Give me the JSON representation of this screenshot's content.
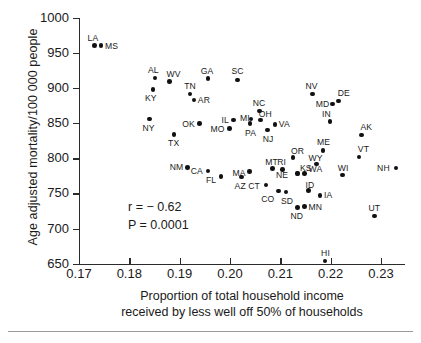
{
  "chart_data": {
    "type": "scatter",
    "title": "",
    "xlabel": "Proportion of total household income received by less well off 50% of households",
    "ylabel": "Age adjusted mortality/100 000 people",
    "xlim": [
      0.17,
      0.2348
    ],
    "ylim": [
      650,
      1000
    ],
    "xticks": [
      0.17,
      0.18,
      0.19,
      0.2,
      0.21,
      0.22,
      0.23
    ],
    "xticklabels": [
      "0.17",
      "0.18",
      "0.19",
      "0.20",
      "0.21",
      "0.22",
      "0.23"
    ],
    "yticks": [
      650,
      700,
      750,
      800,
      850,
      900,
      950,
      1000
    ],
    "yticklabels": [
      "650",
      "700",
      "750",
      "800",
      "850",
      "900",
      "950",
      "1000"
    ],
    "grid": false,
    "legend": null,
    "annotations": {
      "correlation_line": "r = − 0.62",
      "pvalue_line": "P = 0.0001",
      "r": -0.62,
      "p": 0.0001
    },
    "point_label_key": "US state abbreviation",
    "points": [
      {
        "label": "LA",
        "x": 0.1731,
        "y": 960,
        "lx": -7,
        "ly": -13
      },
      {
        "label": "MS",
        "x": 0.1744,
        "y": 960,
        "lx": 4,
        "ly": -5
      },
      {
        "label": "AL",
        "x": 0.1851,
        "y": 914,
        "lx": -7,
        "ly": -13
      },
      {
        "label": "WV",
        "x": 0.188,
        "y": 909,
        "lx": -3,
        "ly": -13
      },
      {
        "label": "GA",
        "x": 0.1956,
        "y": 913,
        "lx": -7,
        "ly": -13
      },
      {
        "label": "SC",
        "x": 0.2015,
        "y": 911,
        "lx": -6,
        "ly": -14
      },
      {
        "label": "KY",
        "x": 0.1847,
        "y": 898,
        "lx": -8,
        "ly": 4
      },
      {
        "label": "TN",
        "x": 0.1921,
        "y": 891,
        "lx": -6,
        "ly": -13
      },
      {
        "label": "AR",
        "x": 0.1928,
        "y": 883,
        "lx": 4,
        "ly": -5
      },
      {
        "label": "NV",
        "x": 0.2164,
        "y": 891,
        "lx": -7,
        "ly": -13
      },
      {
        "label": "DE",
        "x": 0.2216,
        "y": 881,
        "lx": -1,
        "ly": -13
      },
      {
        "label": "MD",
        "x": 0.2204,
        "y": 877,
        "lx": -17,
        "ly": -5
      },
      {
        "label": "NY",
        "x": 0.184,
        "y": 856,
        "lx": -7,
        "ly": 4
      },
      {
        "label": "OK",
        "x": 0.1939,
        "y": 849,
        "lx": -17,
        "ly": -5
      },
      {
        "label": "IL",
        "x": 0.2007,
        "y": 854,
        "lx": -12,
        "ly": -5
      },
      {
        "label": "MO",
        "x": 0.1999,
        "y": 842,
        "lx": -19,
        "ly": -5
      },
      {
        "label": "MI",
        "x": 0.2042,
        "y": 856,
        "lx": -11,
        "ly": -6
      },
      {
        "label": "NC",
        "x": 0.2059,
        "y": 867,
        "lx": -7,
        "ly": -13
      },
      {
        "label": "OH",
        "x": 0.2061,
        "y": 854,
        "lx": -2,
        "ly": -11
      },
      {
        "label": "PA",
        "x": 0.204,
        "y": 849,
        "lx": -5,
        "ly": 4
      },
      {
        "label": "VA",
        "x": 0.2089,
        "y": 848,
        "lx": 4,
        "ly": -5
      },
      {
        "label": "NJ",
        "x": 0.2075,
        "y": 840,
        "lx": -5,
        "ly": 4
      },
      {
        "label": "IN",
        "x": 0.2199,
        "y": 852,
        "lx": -8,
        "ly": -13
      },
      {
        "label": "AK",
        "x": 0.2261,
        "y": 833,
        "lx": -1,
        "ly": -13
      },
      {
        "label": "TX",
        "x": 0.1889,
        "y": 834,
        "lx": -6,
        "ly": 4
      },
      {
        "label": "ME",
        "x": 0.2185,
        "y": 811,
        "lx": -6,
        "ly": -13
      },
      {
        "label": "VT",
        "x": 0.2256,
        "y": 802,
        "lx": -1,
        "ly": -13
      },
      {
        "label": "OR",
        "x": 0.2125,
        "y": 801,
        "lx": -2,
        "ly": -12
      },
      {
        "label": "WY",
        "x": 0.2172,
        "y": 792,
        "lx": -8,
        "ly": -11
      },
      {
        "label": "NM",
        "x": 0.1916,
        "y": 787,
        "lx": -18,
        "ly": -5
      },
      {
        "label": "MT",
        "x": 0.2084,
        "y": 785,
        "lx": -7,
        "ly": -12
      },
      {
        "label": "RI",
        "x": 0.2104,
        "y": 784,
        "lx": -5,
        "ly": -12
      },
      {
        "label": "NH",
        "x": 0.233,
        "y": 786,
        "lx": -19,
        "ly": -5
      },
      {
        "label": "CA",
        "x": 0.1956,
        "y": 782,
        "lx": -17,
        "ly": -5
      },
      {
        "label": "MA",
        "x": 0.2039,
        "y": 781,
        "lx": -17,
        "ly": -4
      },
      {
        "label": "WI",
        "x": 0.2224,
        "y": 776,
        "lx": -5,
        "ly": -12
      },
      {
        "label": "KS",
        "x": 0.2133,
        "y": 778,
        "lx": 3,
        "ly": -11
      },
      {
        "label": "NE",
        "x": 0.2135,
        "y": 778,
        "lx": -22,
        "ly": -4
      },
      {
        "label": "WA",
        "x": 0.2148,
        "y": 778,
        "lx": 4,
        "ly": -10
      },
      {
        "label": "FL",
        "x": 0.1982,
        "y": 774,
        "lx": -15,
        "ly": -1
      },
      {
        "label": "AZ",
        "x": 0.2023,
        "y": 773,
        "lx": -7,
        "ly": 4
      },
      {
        "label": "CT",
        "x": 0.2072,
        "y": 762,
        "lx": -18,
        "ly": -4
      },
      {
        "label": "CO",
        "x": 0.2096,
        "y": 753,
        "lx": -17,
        "ly": 3
      },
      {
        "label": "SD",
        "x": 0.2111,
        "y": 752,
        "lx": -5,
        "ly": 4
      },
      {
        "label": "ID",
        "x": 0.2156,
        "y": 754,
        "lx": -3,
        "ly": -11
      },
      {
        "label": "IA",
        "x": 0.2179,
        "y": 747,
        "lx": 4,
        "ly": -5
      },
      {
        "label": "MN",
        "x": 0.2148,
        "y": 731,
        "lx": 4,
        "ly": -5
      },
      {
        "label": "ND",
        "x": 0.2134,
        "y": 730,
        "lx": -7,
        "ly": 4
      },
      {
        "label": "UT",
        "x": 0.2287,
        "y": 718,
        "lx": -6,
        "ly": -13
      },
      {
        "label": "HI",
        "x": 0.2189,
        "y": 654,
        "lx": -4,
        "ly": -13
      }
    ]
  }
}
